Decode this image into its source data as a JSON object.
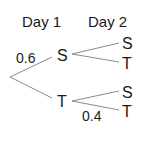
{
  "diagram": {
    "type": "probability-tree",
    "headers": {
      "day1": "Day 1",
      "day2": "Day 2"
    },
    "day1_nodes": {
      "upper": "S",
      "lower": "T"
    },
    "day2_nodes": {
      "upper_upper": "S",
      "upper_lower": "T",
      "lower_upper": "S",
      "lower_lower": "T"
    },
    "probabilities": {
      "root_to_S": "0.6",
      "T_to_T": "0.4"
    },
    "colors": {
      "text": "#1a1a1a",
      "branch": "#8a8a8a",
      "background": "#ffffff"
    }
  }
}
